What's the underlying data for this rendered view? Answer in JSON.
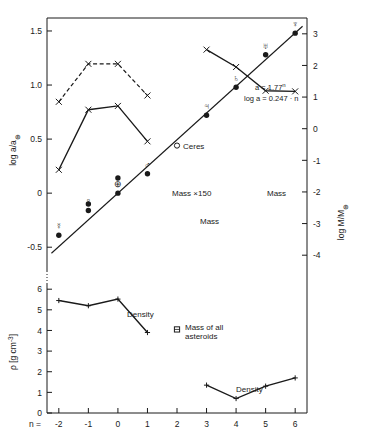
{
  "figure": {
    "title": "",
    "background": "#ffffff",
    "ink": "#1a1a1a"
  },
  "axes": {
    "x": {
      "label": "n =",
      "ticks": [
        "-2",
        "-1",
        "0",
        "1",
        "2",
        "3",
        "4",
        "5",
        "6"
      ],
      "values": [
        -2,
        -1,
        0,
        1,
        2,
        3,
        4,
        5,
        6
      ],
      "range": [
        -2.4,
        6.4
      ]
    },
    "y_left_top": {
      "label": "log a/a",
      "label_sub": "⊕",
      "ticks": [
        "1.5",
        "1.0",
        "0.5",
        "0",
        "-0.5"
      ],
      "values": [
        1.5,
        1.0,
        0.5,
        0.0,
        -0.5
      ],
      "range": [
        -0.72,
        1.62
      ]
    },
    "y_right": {
      "label": "log M/M",
      "label_sub": "⊕",
      "ticks": [
        "3",
        "2",
        "1",
        "0",
        "-1",
        "-2",
        "-3",
        "-4"
      ],
      "values": [
        3,
        2,
        1,
        0,
        -1,
        -2,
        -3,
        -4
      ],
      "range": [
        -4.5,
        3.5
      ]
    },
    "y_left_bottom": {
      "label": "ρ  [g cm",
      "label_sup": "-3",
      "label_close": "]",
      "ticks": [
        "6",
        "5",
        "4",
        "3",
        "2",
        "1",
        "0"
      ],
      "values": [
        6,
        5,
        4,
        3,
        2,
        1,
        0
      ],
      "range": [
        0,
        6.3
      ]
    }
  },
  "annotations": {
    "equation_line1": "a = 1.77",
    "equation_line1_sup": "n",
    "equation_line2": "log a = 0.247 · n",
    "ceres": "Ceres",
    "mass_x150": "Mass  ×150",
    "mass_inner": "Mass",
    "mass_outer": "Mass",
    "density_inner": "Density",
    "density_outer": "Density",
    "asteroids": "Mass of all",
    "asteroids2": "asteroids"
  },
  "planet_symbols": [
    {
      "name": "mercury",
      "glyph": "☿",
      "n": -2,
      "log_a": -0.39
    },
    {
      "name": "venus",
      "glyph": "♀",
      "n": -1,
      "log_a": -0.16
    },
    {
      "name": "earth",
      "glyph": "⊕",
      "n": 0,
      "log_a": 0.0
    },
    {
      "name": "mars",
      "glyph": "♂",
      "n": 1,
      "log_a": 0.18
    },
    {
      "name": "jupiter",
      "glyph": "♃",
      "n": 3,
      "log_a": 0.72
    },
    {
      "name": "saturn",
      "glyph": "♄",
      "n": 4,
      "log_a": 0.98
    },
    {
      "name": "uranus",
      "glyph": "♅",
      "n": 5,
      "log_a": 1.28
    },
    {
      "name": "neptune",
      "glyph": "♆",
      "n": 6,
      "log_a": 1.48
    }
  ],
  "chart_data": {
    "type": "scatter",
    "xlabel": "n =",
    "ylabel": "log a/a⊕",
    "ylabel_right": "log M/M⊕",
    "ylabel_bottom": "ρ [g cm-3]",
    "xlim": [
      -2.4,
      6.4
    ],
    "ylim_top": [
      -0.72,
      1.62
    ],
    "ylim_right": [
      -4.5,
      3.5
    ],
    "ylim_bottom": [
      0,
      6.3
    ],
    "grid": false,
    "legend": "none",
    "series": [
      {
        "name": "log a/a⊕ (planets, filled circles)",
        "marker": "filled-circle",
        "x": [
          -2,
          -1,
          0,
          1,
          3,
          4,
          5,
          6
        ],
        "y": [
          -0.39,
          -0.16,
          0.0,
          0.18,
          0.72,
          0.98,
          1.28,
          1.48
        ]
      },
      {
        "name": "log a/a⊕ (extra points, filled circles)",
        "marker": "filled-circle",
        "x": [
          -1,
          0
        ],
        "y": [
          -0.1,
          0.14
        ]
      },
      {
        "name": "Ceres (open circle)",
        "marker": "open-circle",
        "x": [
          2
        ],
        "y": [
          0.44
        ]
      },
      {
        "name": "fit line a = 1.77^n",
        "marker": "line",
        "x": [
          -2.25,
          6.25
        ],
        "y": [
          -0.556,
          1.544
        ]
      },
      {
        "name": "Mass ×150 (inner planets, dashed, crosses)",
        "marker": "cross",
        "linestyle": "dashed",
        "x": [
          -2,
          -1,
          0,
          1
        ],
        "y_right": [
          0.85,
          2.05,
          2.05,
          1.05
        ]
      },
      {
        "name": "Mass (inner planets, solid, crosses)",
        "marker": "cross",
        "linestyle": "solid",
        "x": [
          -2,
          -1,
          0,
          1
        ],
        "y_right": [
          -1.3,
          0.6,
          0.72,
          -0.4
        ]
      },
      {
        "name": "Mass (outer planets, solid, crosses)",
        "marker": "cross",
        "linestyle": "solid",
        "x": [
          3,
          4,
          5,
          6
        ],
        "y_right": [
          2.5,
          1.95,
          1.2,
          1.18
        ]
      },
      {
        "name": "Mass of all asteroids",
        "marker": "asteroid-square",
        "x": [
          2.0
        ],
        "y_right": [
          -3.1
        ]
      },
      {
        "name": "Density (inner planets)",
        "marker": "plus",
        "x": [
          -2,
          -1,
          0,
          1
        ],
        "y_bottom": [
          5.45,
          5.2,
          5.52,
          3.9
        ]
      },
      {
        "name": "Density (outer planets)",
        "marker": "plus",
        "x": [
          3,
          4,
          5,
          6
        ],
        "y_bottom": [
          1.35,
          0.7,
          1.3,
          1.7
        ]
      }
    ]
  }
}
